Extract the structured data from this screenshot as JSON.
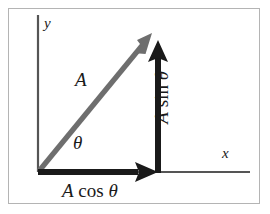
{
  "figure": {
    "background_color": "#ffffff",
    "frame_color": "#b4b4b4"
  },
  "axes": {
    "x_label": "x",
    "y_label": "y",
    "axis_color": "#555555",
    "origin": {
      "x": 38,
      "y": 172
    }
  },
  "vectors": [
    {
      "name": "resultant",
      "label": "A",
      "color": "#6e6e6e",
      "from": {
        "x": 38,
        "y": 172
      },
      "to": {
        "x": 152,
        "y": 33
      }
    },
    {
      "name": "horizontal-component",
      "label": "A cos θ",
      "label_parts": {
        "magnitude": "A",
        "function": "cos",
        "angle": "θ"
      },
      "color": "#1a1a1a",
      "from": {
        "x": 38,
        "y": 172
      },
      "to": {
        "x": 158,
        "y": 172
      }
    },
    {
      "name": "vertical-component",
      "label": "A sin θ",
      "label_parts": {
        "magnitude": "A",
        "function": "sin",
        "angle": "θ"
      },
      "color": "#1a1a1a",
      "from": {
        "x": 158,
        "y": 172
      },
      "to": {
        "x": 158,
        "y": 40
      }
    }
  ],
  "angle": {
    "symbol": "θ",
    "name": "theta"
  },
  "labels": {
    "magnitude": "A",
    "theta": "θ",
    "cos_magnitude": "A",
    "cos_function": "cos",
    "cos_theta": "θ",
    "sin_magnitude": "A",
    "sin_function": "sin",
    "sin_theta": "θ",
    "axis_x": "x",
    "axis_y": "y"
  }
}
